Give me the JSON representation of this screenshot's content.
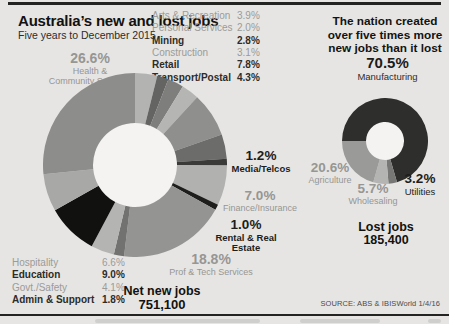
{
  "page": {
    "title": "Australia’s new and lost jobs",
    "subtitle": "Five years to December 2015",
    "headline_lines": [
      "The nation created",
      "over five times more",
      "new jobs than it lost"
    ],
    "source": "SOURCE: ABS & IBISWorld 1/4/16",
    "bg_color": "#e6e5e3",
    "accent_dark": "#232321"
  },
  "main_chart": {
    "net_label": "Net new jobs",
    "net_value": "751,100",
    "top_list": [
      {
        "label": "Arts & Recreation",
        "value": "3.9%",
        "bold": false
      },
      {
        "label": "Personal Services",
        "value": "2.0%",
        "bold": false
      },
      {
        "label": "Mining",
        "value": "2.8%",
        "bold": true
      },
      {
        "label": "Construction",
        "value": "3.1%",
        "bold": false
      },
      {
        "label": "Retail",
        "value": "7.8%",
        "bold": true
      },
      {
        "label": "Transport/Postal",
        "value": "4.3%",
        "bold": true
      }
    ],
    "left_list": [
      {
        "label": "Hospitality",
        "value": "6.6%",
        "bold": false
      },
      {
        "label": "Education",
        "value": "9.0%",
        "bold": true
      },
      {
        "label": "Govt./Safety",
        "value": "4.1%",
        "bold": false
      },
      {
        "label": "Admin & Support",
        "value": "1.8%",
        "bold": true
      }
    ],
    "callouts": {
      "health": {
        "pct": "26.6%",
        "name_line1": "Health &",
        "name_line2": "Community Services"
      },
      "media": {
        "pct": "1.2%",
        "name": "Media/Telcos"
      },
      "finance": {
        "pct": "7.0%",
        "name": "Finance/Insurance"
      },
      "rental": {
        "pct": "1.0%",
        "name": "Rental & Real Estate"
      },
      "proftech": {
        "pct": "18.8%",
        "name": "Prof & Tech Services"
      }
    }
  },
  "lost_chart": {
    "heading_pct": "70.5%",
    "heading_name": "Manufacturing",
    "callouts": {
      "agriculture": {
        "pct": "20.6%",
        "name": "Agriculture"
      },
      "wholesaling": {
        "pct": "5.7%",
        "name": "Wholesaling"
      },
      "utilities": {
        "pct": "3.2%",
        "name": "Utilities"
      }
    },
    "lost_label": "Lost jobs",
    "lost_value": "185,400"
  },
  "chart_data": [
    {
      "id": "main_donut",
      "type": "donut",
      "title": "New jobs by industry, five years to December 2015",
      "units": "% of net new jobs",
      "total_label": "Net new jobs 751,100",
      "rotation": 0,
      "cx": 92,
      "cy": 92,
      "outer_r": 92,
      "inner_r": 42,
      "hole_color": "#f4f3f1",
      "segments": [
        {
          "label": "Arts & Recreation",
          "value": 3.9,
          "color": "#b3b3b1"
        },
        {
          "label": "Personal Services",
          "value": 2.0,
          "color": "#646462"
        },
        {
          "label": "Mining",
          "value": 2.8,
          "color": "#7e7e7c"
        },
        {
          "label": "Construction",
          "value": 3.1,
          "color": "#b5b5b3"
        },
        {
          "label": "Retail",
          "value": 7.8,
          "color": "#8f8f8d"
        },
        {
          "label": "Transport/Postal",
          "value": 4.3,
          "color": "#6c6c6a"
        },
        {
          "label": "Media/Telcos",
          "value": 1.2,
          "color": "#3a3a38"
        },
        {
          "label": "Finance/Insurance",
          "value": 7.0,
          "color": "#b1b1af"
        },
        {
          "label": "Rental & Real Estate",
          "value": 1.0,
          "color": "#1e1e1c"
        },
        {
          "label": "Prof & Tech Services",
          "value": 18.8,
          "color": "#949492"
        },
        {
          "label": "Admin & Support",
          "value": 1.8,
          "color": "#727270"
        },
        {
          "label": "Govt./Safety",
          "value": 4.1,
          "color": "#b4b4b2"
        },
        {
          "label": "Education",
          "value": 9.0,
          "color": "#111110"
        },
        {
          "label": "Hospitality",
          "value": 6.6,
          "color": "#a8a8a6"
        },
        {
          "label": "Health & Community Services",
          "value": 26.6,
          "color": "#8d8d8b"
        }
      ]
    },
    {
      "id": "lost_donut",
      "type": "donut",
      "title": "Lost jobs by industry, five years to December 2015",
      "units": "% of lost jobs",
      "total_label": "Lost jobs 185,400",
      "rotation": 270,
      "cx": 43,
      "cy": 43,
      "outer_r": 43,
      "inner_r": 19,
      "hole_color": "#f4f3f1",
      "segments": [
        {
          "label": "Manufacturing",
          "value": 70.5,
          "color": "#2e2e2c"
        },
        {
          "label": "Utilities",
          "value": 3.2,
          "color": "#777775"
        },
        {
          "label": "Wholesaling",
          "value": 5.7,
          "color": "#b4b4b2"
        },
        {
          "label": "Agriculture",
          "value": 20.6,
          "color": "#9a9a98"
        }
      ]
    }
  ]
}
